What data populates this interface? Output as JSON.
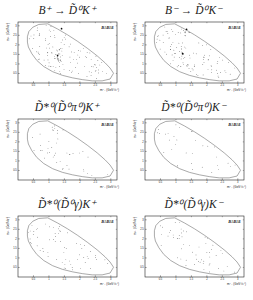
{
  "figure": {
    "background": "#ffffff",
    "ink": "#222222",
    "boundary_color": "#555555",
    "point_color": "#111111",
    "experiment_label": "BaBar",
    "axes": {
      "x_label": "m²₊ (GeV²/c⁴)",
      "y_label": "m²₋ (GeV²/c⁴)",
      "x_min": 0,
      "x_max": 3.2,
      "y_min": 0,
      "y_max": 3.2,
      "x_ticks": [
        0.5,
        1,
        1.5,
        2,
        2.5,
        3
      ],
      "y_ticks": [
        0.5,
        1,
        1.5,
        2,
        2.5,
        3
      ],
      "x_tick_labels": [
        "0.5",
        "1",
        "1.5",
        "2",
        "2.5",
        "3"
      ],
      "y_tick_labels": [
        "0.5",
        "1",
        "1.5",
        "2",
        "2.5",
        "3"
      ]
    },
    "plots": [
      {
        "title": "B⁺ → D̃⁰K⁺",
        "seed": 11,
        "n_uniform": 112,
        "clusters": [
          {
            "cx": 0.44,
            "cy": 0.11,
            "sx": 0.03,
            "sy": 0.035,
            "n": 14
          },
          {
            "cx": 0.4,
            "cy": 0.55,
            "sx": 0.025,
            "sy": 0.09,
            "n": 22
          }
        ]
      },
      {
        "title": "B⁻ → D̃⁰K⁻",
        "seed": 22,
        "n_uniform": 98,
        "clusters": [
          {
            "cx": 0.42,
            "cy": 0.12,
            "sx": 0.03,
            "sy": 0.04,
            "n": 16
          },
          {
            "cx": 0.38,
            "cy": 0.52,
            "sx": 0.03,
            "sy": 0.07,
            "n": 14
          }
        ]
      },
      {
        "title": "D̃*⁰(D̃⁰π⁰)K⁺",
        "seed": 33,
        "n_uniform": 36,
        "clusters": [
          {
            "cx": 0.4,
            "cy": 0.16,
            "sx": 0.05,
            "sy": 0.06,
            "n": 12
          }
        ]
      },
      {
        "title": "D̃*⁰(D̃⁰π⁰)K⁻",
        "seed": 44,
        "n_uniform": 31,
        "clusters": [
          {
            "cx": 0.42,
            "cy": 0.11,
            "sx": 0.04,
            "sy": 0.05,
            "n": 11
          }
        ]
      },
      {
        "title": "D̃*⁰(D̃⁰γ)K⁺",
        "seed": 55,
        "n_uniform": 54,
        "clusters": [
          {
            "cx": 0.34,
            "cy": 0.24,
            "sx": 0.06,
            "sy": 0.1,
            "n": 10
          }
        ]
      },
      {
        "title": "D̃*⁰(D̃⁰γ)K⁻",
        "seed": 66,
        "n_uniform": 50,
        "clusters": [
          {
            "cx": 0.4,
            "cy": 0.2,
            "sx": 0.06,
            "sy": 0.08,
            "n": 9
          }
        ]
      }
    ]
  },
  "chart_data": [
    {
      "type": "scatter",
      "title": "B⁺ → D̃⁰K⁺",
      "legend": "BaBar",
      "xlabel": "m²₊ (GeV²/c⁴)",
      "ylabel": "m²₋ (GeV²/c⁴)",
      "xlim": [
        0,
        3.2
      ],
      "ylim": [
        0,
        3.2
      ],
      "n_points_approx": 148,
      "note": "Dalitz-plot candidates inside kinematic boundary; dense vertical band near m²≈1.2 and cluster at top of boundary"
    },
    {
      "type": "scatter",
      "title": "B⁻ → D̃⁰K⁻",
      "legend": "BaBar",
      "xlabel": "m²₊ (GeV²/c⁴)",
      "ylabel": "m²₋ (GeV²/c⁴)",
      "xlim": [
        0,
        3.2
      ],
      "ylim": [
        0,
        3.2
      ],
      "n_points_approx": 128,
      "note": "Dalitz-plot candidates inside kinematic boundary; two dense clusters on left side"
    },
    {
      "type": "scatter",
      "title": "D̃*⁰(D̃⁰π⁰)K⁺",
      "legend": "BaBar",
      "xlabel": "m²₊ (GeV²/c⁴)",
      "ylabel": "m²₋ (GeV²/c⁴)",
      "xlim": [
        0,
        3.2
      ],
      "ylim": [
        0,
        3.2
      ],
      "n_points_approx": 48,
      "note": "sparser Dalitz-plot candidates, mild clustering near upper-left boundary"
    },
    {
      "type": "scatter",
      "title": "D̃*⁰(D̃⁰π⁰)K⁻",
      "legend": "BaBar",
      "xlabel": "m²₊ (GeV²/c⁴)",
      "ylabel": "m²₋ (GeV²/c⁴)",
      "xlim": [
        0,
        3.2
      ],
      "ylim": [
        0,
        3.2
      ],
      "n_points_approx": 42,
      "note": "sparser Dalitz-plot candidates, mild clustering near upper-left boundary"
    },
    {
      "type": "scatter",
      "title": "D̃*⁰(D̃⁰γ)K⁺",
      "legend": "BaBar",
      "xlabel": "m²₊ (GeV²/c⁴)",
      "ylabel": "m²₋ (GeV²/c⁴)",
      "xlim": [
        0,
        3.2
      ],
      "ylim": [
        0,
        3.2
      ],
      "n_points_approx": 64,
      "note": "Dalitz-plot candidates spread over boundary interior"
    },
    {
      "type": "scatter",
      "title": "D̃*⁰(D̃⁰γ)K⁻",
      "legend": "BaBar",
      "xlabel": "m²₊ (GeV²/c⁴)",
      "ylabel": "m²₋ (GeV²/c⁴)",
      "xlim": [
        0,
        3.2
      ],
      "ylim": [
        0,
        3.2
      ],
      "n_points_approx": 59,
      "note": "Dalitz-plot candidates spread over boundary interior"
    }
  ]
}
